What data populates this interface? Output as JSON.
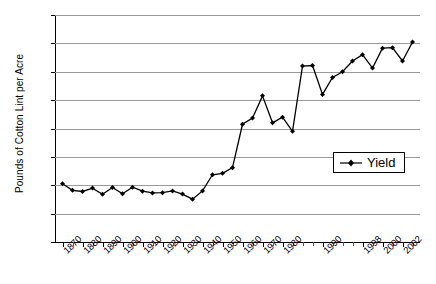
{
  "chart_data": {
    "type": "line",
    "title": "",
    "xlabel": "",
    "ylabel": "Pounds of Cotton Lint per Acre",
    "ylim": [
      0,
      800
    ],
    "ytick_step": 100,
    "yticks": [
      "0",
      "100",
      "200",
      "300",
      "400",
      "500",
      "600",
      "700",
      "800"
    ],
    "xtick_labels": [
      "1870",
      "1880",
      "1890",
      "1900",
      "1910",
      "1920",
      "1930",
      "1940",
      "1950",
      "1960",
      "1970",
      "1980",
      "1990",
      "1998",
      "2000",
      "2002"
    ],
    "grid": "horizontal",
    "legend_position": "inside-right",
    "series": [
      {
        "name": "Yield",
        "marker": "diamond",
        "color": "#000000",
        "x": [
          1870,
          1875,
          1880,
          1885,
          1890,
          1895,
          1900,
          1905,
          1910,
          1915,
          1920,
          1925,
          1930,
          1935,
          1940,
          1945,
          1950,
          1955,
          1960,
          1965,
          1970,
          1975,
          1980,
          1985,
          1986,
          1988,
          1990,
          1992,
          1994,
          1996,
          1998,
          1999,
          2000,
          2001,
          2002,
          2003
        ],
        "values": [
          205,
          182,
          178,
          190,
          168,
          192,
          170,
          193,
          179,
          173,
          174,
          180,
          169,
          151,
          180,
          237,
          242,
          262,
          415,
          437,
          515,
          420,
          440,
          390,
          620,
          622,
          520,
          580,
          600,
          638,
          660,
          613,
          683,
          685,
          638,
          705
        ]
      }
    ]
  },
  "legend": {
    "label": "Yield"
  }
}
